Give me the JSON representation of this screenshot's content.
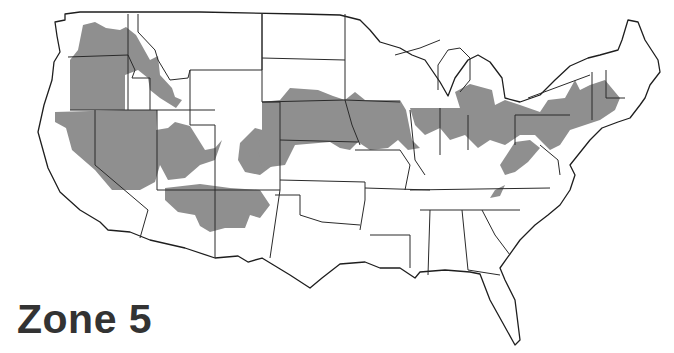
{
  "title": "Zone 5",
  "map": {
    "subject": "Contiguous United States",
    "shaded_label": "Zone 5",
    "colors": {
      "shaded": "#8f8f8f",
      "border": "#2a2a2a",
      "background": "#ffffff",
      "title": "#333333"
    }
  }
}
